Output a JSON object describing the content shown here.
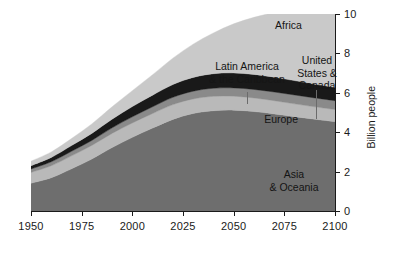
{
  "chart_data": {
    "type": "area",
    "stacked": true,
    "title": "",
    "subtitle": "",
    "xlabel": "",
    "ylabel": "Billion people",
    "xlim": [
      1950,
      2100
    ],
    "ylim": [
      0,
      10
    ],
    "grid": false,
    "legend_position": "inline-annotations",
    "x_ticks": [
      1950,
      1975,
      2000,
      2025,
      2050,
      2075,
      2100
    ],
    "x_tick_labels": [
      "1950",
      "1975",
      "2000",
      "2025",
      "2050",
      "2075",
      "2100"
    ],
    "y_ticks": [
      0,
      2,
      4,
      6,
      8,
      10
    ],
    "y_tick_labels": [
      "0",
      "2",
      "4",
      "6",
      "8",
      "10"
    ],
    "x": [
      1950,
      1960,
      1970,
      1980,
      1990,
      2000,
      2010,
      2020,
      2030,
      2040,
      2050,
      2060,
      2070,
      2080,
      2090,
      2100
    ],
    "series": [
      {
        "name": "Asia & Oceania",
        "color": "#6e6e6e",
        "values": [
          1.41,
          1.69,
          2.14,
          2.64,
          3.22,
          3.74,
          4.21,
          4.65,
          4.95,
          5.09,
          5.12,
          5.05,
          4.93,
          4.79,
          4.66,
          4.54
        ]
      },
      {
        "name": "Europe",
        "color": "#b9b9b9",
        "values": [
          0.55,
          0.61,
          0.66,
          0.69,
          0.72,
          0.73,
          0.74,
          0.75,
          0.74,
          0.73,
          0.71,
          0.69,
          0.67,
          0.65,
          0.63,
          0.61
        ]
      },
      {
        "name": "United States & Canada",
        "color": "#8a8a8a",
        "values": [
          0.17,
          0.2,
          0.23,
          0.25,
          0.28,
          0.31,
          0.34,
          0.37,
          0.39,
          0.41,
          0.42,
          0.43,
          0.44,
          0.45,
          0.45,
          0.45
        ]
      },
      {
        "name": "Latin America & the Caribbean",
        "color": "#191919",
        "values": [
          0.17,
          0.22,
          0.29,
          0.36,
          0.44,
          0.52,
          0.59,
          0.65,
          0.7,
          0.74,
          0.76,
          0.76,
          0.75,
          0.73,
          0.7,
          0.68
        ]
      },
      {
        "name": "Africa",
        "color": "#c9c9c9",
        "values": [
          0.23,
          0.28,
          0.36,
          0.48,
          0.63,
          0.81,
          1.04,
          1.34,
          1.69,
          2.07,
          2.49,
          2.9,
          3.28,
          3.62,
          3.9,
          4.12
        ]
      }
    ],
    "totals": [
      2.53,
      3.0,
      3.68,
      4.42,
      5.29,
      6.11,
      6.92,
      7.76,
      8.47,
      9.04,
      9.5,
      9.83,
      10.07,
      10.24,
      10.34,
      10.4
    ],
    "annotations": [
      {
        "id": "africa",
        "text_lines": [
          "Africa"
        ],
        "leader": false
      },
      {
        "id": "latam",
        "text_lines": [
          "Latin America",
          "& the Caribbean"
        ],
        "leader": true
      },
      {
        "id": "usca",
        "text_lines": [
          "United",
          "States &",
          "Canada"
        ],
        "leader": true
      },
      {
        "id": "europe",
        "text_lines": [
          "Europe"
        ],
        "leader": false
      },
      {
        "id": "asia",
        "text_lines": [
          "Asia",
          "& Oceania"
        ],
        "leader": false
      }
    ]
  },
  "labels": {
    "africa": "Africa",
    "latam_line1": "Latin America",
    "latam_line2": "& the Caribbean",
    "usca_line1": "United",
    "usca_line2": "States &",
    "usca_line3": "Canada",
    "europe": "Europe",
    "asia_line1": "Asia",
    "asia_line2": "& Oceania",
    "y_axis_title": "Billion people"
  },
  "x_tick_labels": [
    "1950",
    "1975",
    "2000",
    "2025",
    "2050",
    "2075",
    "2100"
  ],
  "y_tick_labels": [
    "0",
    "2",
    "4",
    "6",
    "8",
    "10"
  ],
  "colors": {
    "asia": "#6e6e6e",
    "europe": "#b9b9b9",
    "united_states_canada": "#8a8a8a",
    "latin_america": "#191919",
    "africa": "#c9c9c9",
    "axis": "#1a1a1a",
    "background": "#ffffff"
  }
}
